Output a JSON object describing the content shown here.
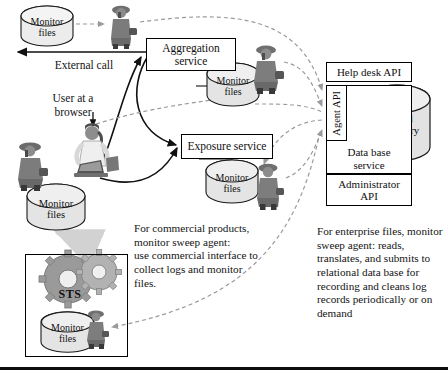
{
  "diagram": {
    "nodes": [
      {
        "id": "aggregation",
        "label": "Aggregation\nservice",
        "x": 146,
        "y": 38,
        "w": 90,
        "h": 33,
        "font": 11.5
      },
      {
        "id": "exposure",
        "label": "Exposure service",
        "x": 181,
        "y": 134,
        "w": 92,
        "h": 25,
        "font": 11.5
      },
      {
        "id": "help_desk_api",
        "label": "Help desk API",
        "x": 326,
        "y": 62,
        "w": 86,
        "h": 20,
        "font": 11
      },
      {
        "id": "agent_api",
        "label": "Agent API",
        "x": 326,
        "y": 85,
        "w": 21,
        "h": 56,
        "font": 10.5,
        "vertical": true
      },
      {
        "id": "data_base_service",
        "label": "Data base\nservice",
        "x": 326,
        "y": 141,
        "w": 86,
        "h": 33,
        "font": 11
      },
      {
        "id": "administrator_api",
        "label": "Administrator\nAPI",
        "x": 326,
        "y": 174,
        "w": 86,
        "h": 32,
        "font": 11
      },
      {
        "id": "sts",
        "label": "STS",
        "x": 25,
        "y": 254,
        "w": 103,
        "h": 103,
        "font": 12
      }
    ],
    "cylinders": [
      {
        "id": "monitor-files-top-left",
        "label": "Monitor\nfiles",
        "x": 21,
        "y": 6,
        "w": 52,
        "h": 40,
        "font": 10
      },
      {
        "id": "monitor-files-aggregation",
        "label": "Monitor\nfiles",
        "x": 207,
        "y": 63,
        "w": 52,
        "h": 43,
        "font": 10
      },
      {
        "id": "monitor-files-exposure",
        "label": "Monitor\nfiles",
        "x": 206,
        "y": 160,
        "w": 52,
        "h": 43,
        "font": 10
      },
      {
        "id": "monitor-files-user",
        "label": "Monitor\nfiles",
        "x": 27,
        "y": 184,
        "w": 58,
        "h": 46,
        "font": 10
      },
      {
        "id": "monitor-files-sts",
        "label": "Monitor\nfiles",
        "x": 41,
        "y": 312,
        "w": 53,
        "h": 40,
        "font": 10
      },
      {
        "id": "central-repository",
        "label": "Central\nrepository",
        "x": 364,
        "y": 85,
        "w": 66,
        "h": 76,
        "font": 11
      }
    ],
    "arrow_labels": [
      {
        "id": "external-call",
        "text": "External call",
        "x": 24,
        "y": 59,
        "w": 120,
        "font": 11.5
      },
      {
        "id": "user-at-a-browser",
        "text": "User at a\nbrowser",
        "x": 38,
        "y": 92,
        "w": 70,
        "font": 11.5
      }
    ],
    "annotations": [
      {
        "id": "commercial-products-note",
        "text": "For commercial products,\nmonitor sweep agent:\nuse commercial interface to\ncollect logs and  monitor\nfiles.",
        "x": 134,
        "y": 222,
        "w": 135,
        "font": 11.2
      },
      {
        "id": "enterprise-files-note",
        "text": "For enterprise files, monitor\nsweep agent: reads,\ntranslates, and submits to\nrelational data base for\nrecording and cleans log\nrecords periodically or on\ndemand",
        "x": 317,
        "y": 225,
        "w": 128,
        "font": 11.2
      }
    ],
    "figures": [
      {
        "id": "agent-figure-top",
        "x": 106,
        "y": 4,
        "w": 32,
        "h": 44
      },
      {
        "id": "agent-figure-aggregation",
        "x": 250,
        "y": 44,
        "w": 34,
        "h": 50
      },
      {
        "id": "agent-figure-exposure",
        "x": 253,
        "y": 162,
        "w": 32,
        "h": 48
      },
      {
        "id": "agent-figure-user-left",
        "x": 14,
        "y": 140,
        "w": 34,
        "h": 50
      },
      {
        "id": "agent-figure-sts",
        "x": 84,
        "y": 309,
        "w": 26,
        "h": 41
      },
      {
        "id": "user-browser-figure",
        "x": 68,
        "y": 120,
        "w": 52,
        "h": 72
      }
    ],
    "colors": {
      "line": "#111111",
      "dashed": "#9a9a9a",
      "node_fill": "#ffffff",
      "cylinder_fill": "#e8e8e8",
      "rule": "#0c0c0c"
    }
  }
}
